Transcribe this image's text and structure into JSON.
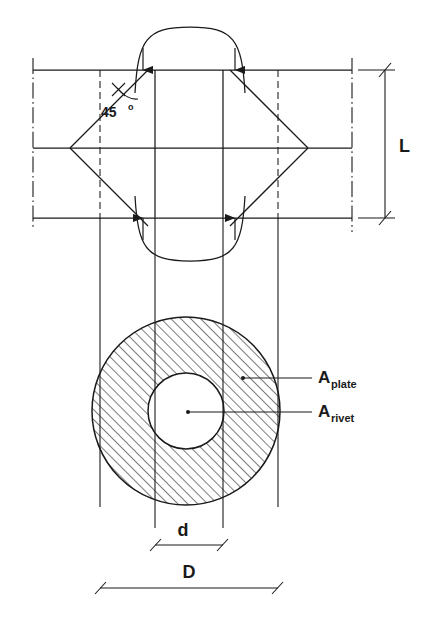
{
  "figure": {
    "domain_type": "engineering-drawing",
    "stroke_color": "#1a1a1a",
    "background_color": "#ffffff"
  },
  "labels": {
    "angle": {
      "value": "45",
      "degree_symbol": "o",
      "full": "45o"
    },
    "plate_length": "L",
    "rivet_diameter": "d",
    "plate_diameter": "D",
    "area_plate": {
      "base": "A",
      "subscript": "plate"
    },
    "area_rivet": {
      "base": "A",
      "subscript": "rivet"
    }
  },
  "upper_view": {
    "name": "section-elevation-view",
    "description": "Rivet shown in section between two plates with 45 degree crack lines",
    "horizontal_lines": [
      {
        "name": "top-plate-surface",
        "y": 70
      },
      {
        "name": "mid-centerline",
        "y": 148
      },
      {
        "name": "bottom-plate-surface",
        "y": 218
      }
    ],
    "centerlines": [
      {
        "name": "left-vertical-centerline",
        "x": 33
      },
      {
        "name": "right-vertical-centerline",
        "x": 352
      }
    ],
    "rivet_shank": {
      "left_rect_x": 100,
      "left_rect_w": 55,
      "right_rect_x": 223,
      "right_rect_w": 55,
      "top_y": 70,
      "bottom_y": 218
    },
    "arrows": [
      {
        "name": "load-arrow-top-left",
        "direction": "down"
      },
      {
        "name": "load-arrow-top-right",
        "direction": "down"
      },
      {
        "name": "load-arrow-bottom-left",
        "direction": "up"
      },
      {
        "name": "load-arrow-bottom-right",
        "direction": "up"
      }
    ]
  },
  "lower_view": {
    "name": "plan-area-view",
    "description": "Annular hatched area showing plate bearing area around rivet hole",
    "outer_circle": {
      "cx": 186,
      "cy": 411,
      "r": 94
    },
    "inner_circle": {
      "cx": 186,
      "cy": 411,
      "r": 38
    },
    "hatch_angle_deg": 45,
    "vertical_projection_lines": [
      100,
      155,
      223,
      278
    ]
  },
  "dimensions": [
    {
      "name": "dimension-L",
      "label": "L",
      "orientation": "vertical",
      "x": 385,
      "y1": 70,
      "y2": 218
    },
    {
      "name": "dimension-d",
      "label": "d",
      "orientation": "horizontal",
      "y": 545,
      "x1": 155,
      "x2": 223
    },
    {
      "name": "dimension-D",
      "label": "D",
      "orientation": "horizontal",
      "y": 588,
      "x1": 100,
      "x2": 278
    }
  ],
  "leaders": [
    {
      "name": "leader-a-plate",
      "from_x": 243,
      "from_y": 378,
      "to_x": 310,
      "to_y": 378
    },
    {
      "name": "leader-a-rivet",
      "from_x": 188,
      "from_y": 412,
      "to_x": 310,
      "to_y": 412
    }
  ]
}
